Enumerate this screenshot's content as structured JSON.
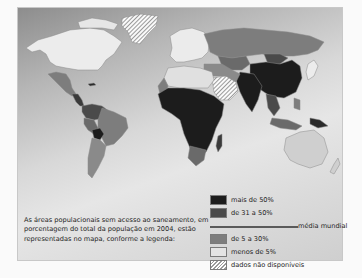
{
  "figure": {
    "caption": "As áreas populacionais sem acesso ao saneamento, em porcentagem do total da população em 2004, estão representadas no mapa, conforme a legenda:",
    "legend": {
      "items": [
        {
          "label": "mais de 50%",
          "color": "#1c1c1c",
          "pattern": "solid"
        },
        {
          "label": "de 31 a 50%",
          "color": "#4a4a4a",
          "pattern": "solid"
        },
        {
          "label": "de 5 a 30%",
          "color": "#7d7d7d",
          "pattern": "solid"
        },
        {
          "label": "menos de 5%",
          "color": "#e4e4e4",
          "pattern": "solid"
        },
        {
          "label": "dados não disponíveis",
          "color": "#ffffff",
          "pattern": "hatched"
        }
      ],
      "divider_label": "média mundial"
    },
    "colors": {
      "more_than_50": "#1c1c1c",
      "31_to_50": "#4a4a4a",
      "5_to_30": "#7d7d7d",
      "less_than_5": "#e4e4e4",
      "no_data": "hatched"
    }
  }
}
